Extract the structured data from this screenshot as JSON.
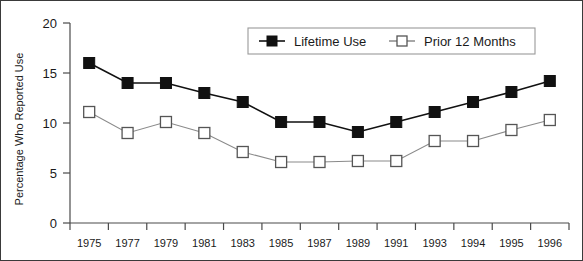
{
  "chart_data": {
    "type": "line",
    "title": "",
    "subtitle": "",
    "xlabel": "",
    "ylabel": "Percentage Who Reported Use",
    "categories": [
      "1975",
      "1977",
      "1979",
      "1981",
      "1983",
      "1985",
      "1987",
      "1989",
      "1991",
      "1993",
      "1994",
      "1995",
      "1996"
    ],
    "ylim": [
      0,
      20
    ],
    "yticks": [
      "0",
      "5",
      "10",
      "15",
      "20"
    ],
    "ytick_values": [
      0,
      5,
      10,
      15,
      20
    ],
    "grid": false,
    "legend_position": "top-right-inside",
    "series": [
      {
        "name": "Lifetime Use",
        "marker": "filled-square",
        "color": "#111111",
        "values": [
          16.0,
          14.0,
          14.0,
          13.0,
          12.1,
          10.1,
          10.1,
          9.1,
          10.1,
          11.1,
          12.1,
          13.1,
          14.2
        ]
      },
      {
        "name": "Prior 12 Months",
        "marker": "open-square",
        "color": "#8a8a8a",
        "values": [
          11.1,
          9.0,
          10.1,
          9.0,
          7.1,
          6.1,
          6.1,
          6.2,
          6.2,
          8.2,
          8.2,
          9.3,
          10.3
        ]
      }
    ]
  },
  "legend": {
    "items": [
      {
        "label": "Lifetime Use",
        "marker": "filled-square"
      },
      {
        "label": "Prior 12 Months",
        "marker": "open-square"
      }
    ]
  },
  "colors": {
    "frame": "#3a3a3a",
    "axis": "#4a4a4a",
    "series_lifetime": "#111111",
    "series_prior": "#8a8a8a",
    "background": "#ffffff"
  }
}
